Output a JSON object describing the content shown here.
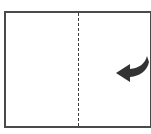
{
  "diagram": {
    "type": "paper-fold-instruction",
    "description": "Rectangular sheet with a vertical dashed fold line at the center and a curved arrow indicating the right half folds over to the left",
    "sheet": {
      "border_color": "#4a4a4a",
      "fill": "#ffffff"
    },
    "fold_line": {
      "style": "dashed",
      "orientation": "vertical",
      "position": "center",
      "color": "#3a3a3a"
    },
    "arrow": {
      "icon": "curved-fold-arrow-left",
      "direction": "left",
      "color": "#333333"
    }
  }
}
